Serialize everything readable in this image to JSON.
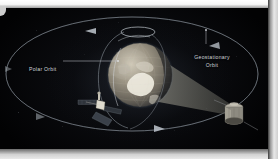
{
  "figure": {
    "type": "orbit-diagram",
    "background_color": "#050607",
    "labels": {
      "polar_orbit": "Polar Orbit",
      "geostationary_orbit_line1": "Geostationary",
      "geostationary_orbit_line2": "Orbit"
    },
    "elements": {
      "earth": {
        "name": "earth-globe",
        "center_x": 140,
        "center_y": 75,
        "radius": 32,
        "base_color": "#8d8271",
        "highlight_color": "#e8e4d6",
        "terminator": "right-limb-shadow"
      },
      "geostationary_orbit_ellipse": {
        "name": "geostationary-orbit-ellipse",
        "center_x": 132,
        "center_y": 74,
        "radius_x": 126,
        "radius_y": 57,
        "stroke_color": "#6f7780",
        "direction": "counter-clockwise",
        "arrow_count": 4
      },
      "polar_orbit_ring": {
        "name": "polar-orbit-ring",
        "stroke_color": "#9aa2ab",
        "inclination": "near-vertical"
      },
      "earth_shadow_cone": {
        "name": "earth-shadow-cone",
        "fill_color": "#5c5c58",
        "apex_direction": "right"
      },
      "polar_satellite": {
        "name": "polar-satellite",
        "x": 100,
        "y": 103,
        "body_color": "#d8d4c8",
        "panel_color": "#3a3f46"
      },
      "geostationary_satellite": {
        "name": "geostationary-satellite",
        "x": 233,
        "y": 108,
        "body_color": "#9a958a",
        "shape": "cylindrical"
      }
    },
    "orbit_arrows": [
      {
        "name": "orbit-arrow-top",
        "x": 92,
        "y": 28,
        "direction": "left"
      },
      {
        "name": "orbit-arrow-right",
        "x": 213,
        "y": 40,
        "direction": "left"
      },
      {
        "name": "orbit-arrow-bottom",
        "x": 158,
        "y": 130,
        "direction": "right"
      },
      {
        "name": "orbit-arrow-left",
        "x": 43,
        "y": 118,
        "direction": "right"
      }
    ],
    "leader_lines": [
      {
        "name": "polar-orbit-leader",
        "from_x": 63,
        "from_y": 61,
        "to_x": 117,
        "to_y": 61
      },
      {
        "name": "geostationary-orbit-leader",
        "from_x": 206,
        "from_y": 31,
        "to_x": 206,
        "to_y": 44
      }
    ]
  }
}
